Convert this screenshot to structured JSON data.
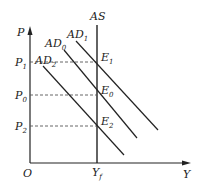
{
  "diagram": {
    "axes": {
      "y_label": "P",
      "x_label": "Y",
      "origin_label": "O"
    },
    "curves": {
      "as": {
        "label": "AS"
      },
      "ad1": {
        "base": "AD",
        "sub": "1"
      },
      "ad0": {
        "base": "AD",
        "sub": "0"
      },
      "ad2": {
        "base": "AD",
        "sub": "2"
      }
    },
    "price_levels": [
      {
        "base": "P",
        "sub": "1"
      },
      {
        "base": "P",
        "sub": "0"
      },
      {
        "base": "P",
        "sub": "2"
      }
    ],
    "equilibria": [
      {
        "base": "E",
        "sub": "1"
      },
      {
        "base": "E",
        "sub": "0"
      },
      {
        "base": "E",
        "sub": "2"
      }
    ],
    "output_level": {
      "base": "Y",
      "sub": "f"
    },
    "colors": {
      "line": "#222222",
      "dash": "#555555"
    }
  }
}
